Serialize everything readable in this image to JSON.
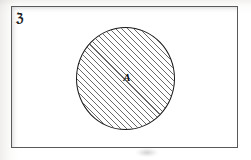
{
  "figure": {
    "width": 251,
    "height": 160,
    "background_color": "#ffffff"
  },
  "universe": {
    "label": "ℨ",
    "label_name": "universal-set-symbol",
    "shape": "rectangle",
    "border_color": "#5a5a5c",
    "fill_color": "#ffffff"
  },
  "set_a": {
    "label": "A",
    "shape": "circle",
    "fill": "diagonal-hatch",
    "hatch_angle_degrees": 45,
    "hatch_color": "#2f2f33",
    "border_color": "#18181a"
  }
}
